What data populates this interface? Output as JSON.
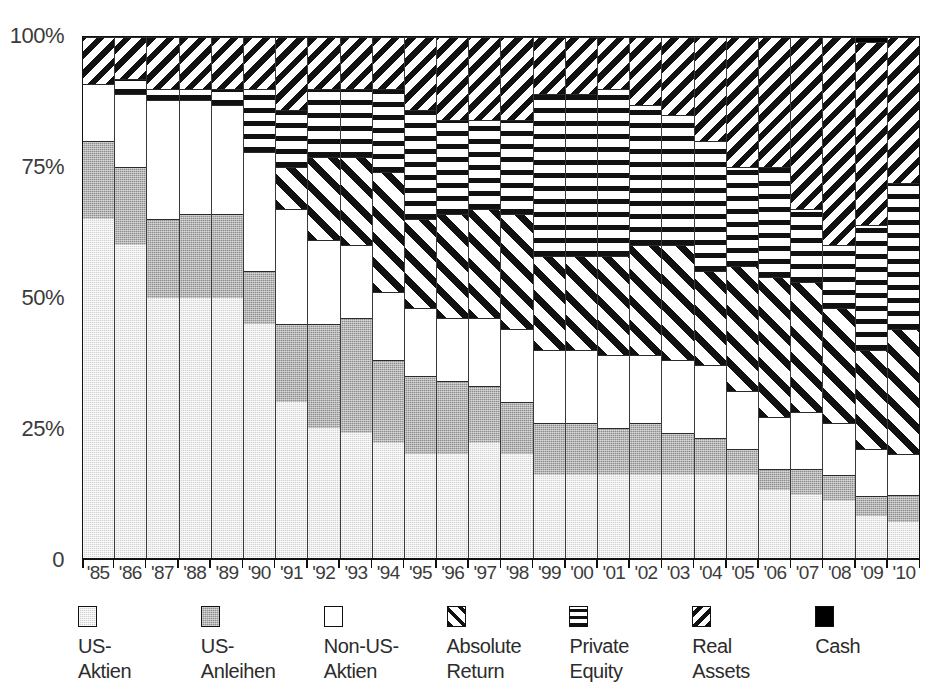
{
  "chart_data": {
    "type": "bar",
    "subtype": "stacked-percentage",
    "title": "",
    "xlabel": "",
    "ylabel": "",
    "ylim": [
      0,
      100
    ],
    "y_ticks": [
      "0",
      "25%",
      "50%",
      "75%",
      "100%"
    ],
    "y_tick_values": [
      0,
      25,
      50,
      75,
      100
    ],
    "grid": false,
    "legend_position": "bottom",
    "stack_order_bottom_to_top": [
      "US-Aktien",
      "US-Anleihen",
      "Non-US-Aktien",
      "Absolute Return",
      "Private Equity",
      "Real Assets",
      "Cash"
    ],
    "categories": [
      "'85",
      "'86",
      "'87",
      "'88",
      "'89",
      "'90",
      "'91",
      "'92",
      "'93",
      "'94",
      "'95",
      "'96",
      "'97",
      "'98",
      "'99",
      "'00",
      "'01",
      "'02",
      "'03",
      "'04",
      "'05",
      "'06",
      "'07",
      "'08",
      "'09",
      "'10"
    ],
    "series": [
      {
        "name": "US-Aktien",
        "pattern": "light-stipple-grey",
        "color": "#d2d2d2",
        "values": [
          65,
          60,
          50,
          50,
          50,
          45,
          30,
          25,
          24,
          22,
          20,
          20,
          22,
          20,
          16,
          16,
          16,
          16,
          16,
          16,
          16,
          13,
          12,
          11,
          8,
          7
        ]
      },
      {
        "name": "US-Anleihen",
        "pattern": "medium-stipple-grey",
        "color": "#8e8e8e",
        "values": [
          15,
          15,
          15,
          16,
          16,
          10,
          15,
          20,
          22,
          16,
          15,
          14,
          11,
          10,
          10,
          10,
          9,
          10,
          8,
          7,
          5,
          4,
          5,
          5,
          4,
          5
        ]
      },
      {
        "name": "Non-US-Aktien",
        "pattern": "white",
        "color": "#ffffff",
        "values": [
          11,
          14,
          23,
          22,
          21,
          23,
          22,
          16,
          14,
          13,
          13,
          12,
          13,
          14,
          14,
          14,
          14,
          13,
          14,
          14,
          11,
          10,
          11,
          10,
          9,
          8
        ]
      },
      {
        "name": "Absolute Return",
        "pattern": "diagonal-stripes-up",
        "color": "#ffffff",
        "values": [
          0,
          0,
          0,
          0,
          0,
          0,
          8,
          16,
          17,
          23,
          17,
          20,
          21,
          22,
          18,
          18,
          19,
          21,
          22,
          18,
          24,
          27,
          25,
          22,
          19,
          24
        ]
      },
      {
        "name": "Private Equity",
        "pattern": "horizontal-stripes",
        "color": "#ffffff",
        "values": [
          0,
          3,
          2,
          2,
          3,
          12,
          11,
          13,
          13,
          16,
          21,
          18,
          17,
          18,
          31,
          31,
          32,
          27,
          25,
          25,
          19,
          21,
          14,
          12,
          24,
          28
        ]
      },
      {
        "name": "Real Assets",
        "pattern": "diagonal-stripes-down",
        "color": "#ffffff",
        "values": [
          9,
          8,
          10,
          10,
          10,
          10,
          14,
          10,
          10,
          10,
          14,
          16,
          16,
          16,
          11,
          11,
          10,
          13,
          15,
          20,
          25,
          25,
          33,
          40,
          35,
          28
        ]
      },
      {
        "name": "Cash",
        "pattern": "solid-black",
        "color": "#000000",
        "values": [
          0,
          0,
          0,
          0,
          0,
          0,
          0,
          0,
          0,
          0,
          0,
          0,
          0,
          0,
          0,
          0,
          0,
          0,
          0,
          0,
          0,
          0,
          0,
          0,
          1,
          0
        ]
      }
    ]
  },
  "legend": {
    "items": [
      {
        "label": "US-\nAktien",
        "pattern_class": "p-usstock",
        "swatch_name": "legend-swatch-us-aktien"
      },
      {
        "label": "US-\nAnleihen",
        "pattern_class": "p-usbond",
        "swatch_name": "legend-swatch-us-anleihen"
      },
      {
        "label": "Non-US-\nAktien",
        "pattern_class": "p-nonus",
        "swatch_name": "legend-swatch-non-us-aktien"
      },
      {
        "label": "Absolute\nReturn",
        "pattern_class": "p-absret",
        "swatch_name": "legend-swatch-absolute-return"
      },
      {
        "label": "Private\nEquity",
        "pattern_class": "p-pe",
        "swatch_name": "legend-swatch-private-equity"
      },
      {
        "label": "Real\nAssets",
        "pattern_class": "p-real",
        "swatch_name": "legend-swatch-real-assets"
      },
      {
        "label": "Cash",
        "pattern_class": "p-cash",
        "swatch_name": "legend-swatch-cash"
      }
    ]
  }
}
